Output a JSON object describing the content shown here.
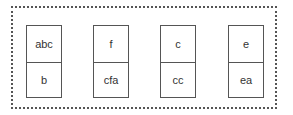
{
  "diagram": {
    "container": "dotted-group",
    "cells": [
      {
        "top": "abc",
        "bottom": "b"
      },
      {
        "top": "f",
        "bottom": "cfa"
      },
      {
        "top": "c",
        "bottom": "cc"
      },
      {
        "top": "e",
        "bottom": "ea"
      }
    ]
  }
}
